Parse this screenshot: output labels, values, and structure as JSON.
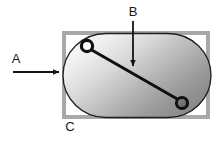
{
  "diagram": {
    "background_color": "#ffffff",
    "labels": {
      "a": "A",
      "b": "B",
      "c": "C"
    },
    "annotations": [
      {
        "id": "a",
        "label": "A",
        "pointer": "arrow-right",
        "points_to": "frame-left-edge",
        "description": "Horizontal arrow pointing right toward the outer frame"
      },
      {
        "id": "b",
        "label": "B",
        "pointer": "arrow-down",
        "points_to": "diagonal-line",
        "description": "Vertical arrow pointing down toward the diagonal line inside the shape"
      },
      {
        "id": "c",
        "label": "C",
        "pointer": "none",
        "points_to": "outer-frame",
        "description": "Label beneath the bottom-left of the outer grey frame"
      }
    ],
    "frame": {
      "name": "outer-frame",
      "stroke_color": "#a8a8a8",
      "fill_color": "#ffffff",
      "stroke_width": 4,
      "x": 62,
      "y": 31,
      "width": 148,
      "height": 88
    },
    "body_shape": {
      "name": "stadium-shape",
      "shape": "rounded-rectangle",
      "stroke_color": "#1a1a1a",
      "gradient_from": "#f2f2f2",
      "gradient_to": "#8e8e8e",
      "stroke_width": 1.3
    },
    "diagonal_line": {
      "name": "diagonal-line",
      "stroke_color": "#101010",
      "stroke_width": 3,
      "from": "top-left-node",
      "to": "bottom-right-node"
    },
    "nodes": [
      {
        "id": "top-left-node",
        "name": "node-open",
        "cx": 87,
        "cy": 46,
        "r": 6,
        "fill": "#ffffff",
        "stroke": "#101010"
      },
      {
        "id": "bottom-right-node",
        "name": "node-filled",
        "cx": 182,
        "cy": 103,
        "r": 6,
        "fill": "#6e6e6e",
        "stroke": "#101010"
      }
    ]
  }
}
